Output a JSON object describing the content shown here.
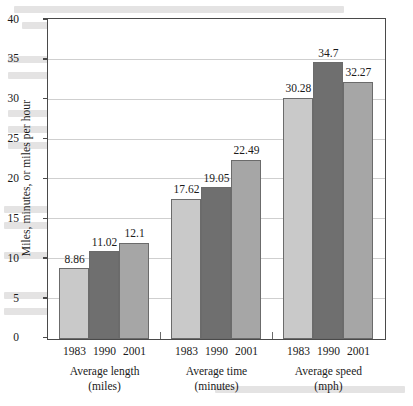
{
  "chart_data": {
    "type": "bar",
    "title": "",
    "xlabel": "",
    "ylabel": "Miles, minutes, or miles per hour",
    "ylim": [
      0,
      40
    ],
    "yticks": [
      0,
      5,
      10,
      15,
      20,
      25,
      30,
      35,
      40
    ],
    "grid": true,
    "legend_position": "none",
    "categories": [
      "Average length\n(miles)",
      "Average time\n(minutes)",
      "Average speed\n(mph)"
    ],
    "series": [
      {
        "name": "1983",
        "values": [
          8.86,
          17.62,
          30.28
        ],
        "color": "#c9c9c9"
      },
      {
        "name": "1990",
        "values": [
          11.02,
          19.05,
          34.7
        ],
        "color": "#6f6f6f"
      },
      {
        "name": "2001",
        "values": [
          12.1,
          22.49,
          32.27
        ],
        "color": "#a6a6a6"
      }
    ],
    "groups": [
      {
        "label_line1": "Average length",
        "label_line2": "(miles)",
        "bars": [
          {
            "year": "1983",
            "value": 8.86,
            "value_label": "8.86"
          },
          {
            "year": "1990",
            "value": 11.02,
            "value_label": "11.02"
          },
          {
            "year": "2001",
            "value": 12.1,
            "value_label": "12.1"
          }
        ]
      },
      {
        "label_line1": "Average time",
        "label_line2": "(minutes)",
        "bars": [
          {
            "year": "1983",
            "value": 17.62,
            "value_label": "17.62"
          },
          {
            "year": "1990",
            "value": 19.05,
            "value_label": "19.05"
          },
          {
            "year": "2001",
            "value": 22.49,
            "value_label": "22.49"
          }
        ]
      },
      {
        "label_line1": "Average speed",
        "label_line2": "(mph)",
        "bars": [
          {
            "year": "1983",
            "value": 30.28,
            "value_label": "30.28"
          },
          {
            "year": "1990",
            "value": 34.7,
            "value_label": "34.7"
          },
          {
            "year": "2001",
            "value": 32.27,
            "value_label": "32.27"
          }
        ]
      }
    ]
  }
}
